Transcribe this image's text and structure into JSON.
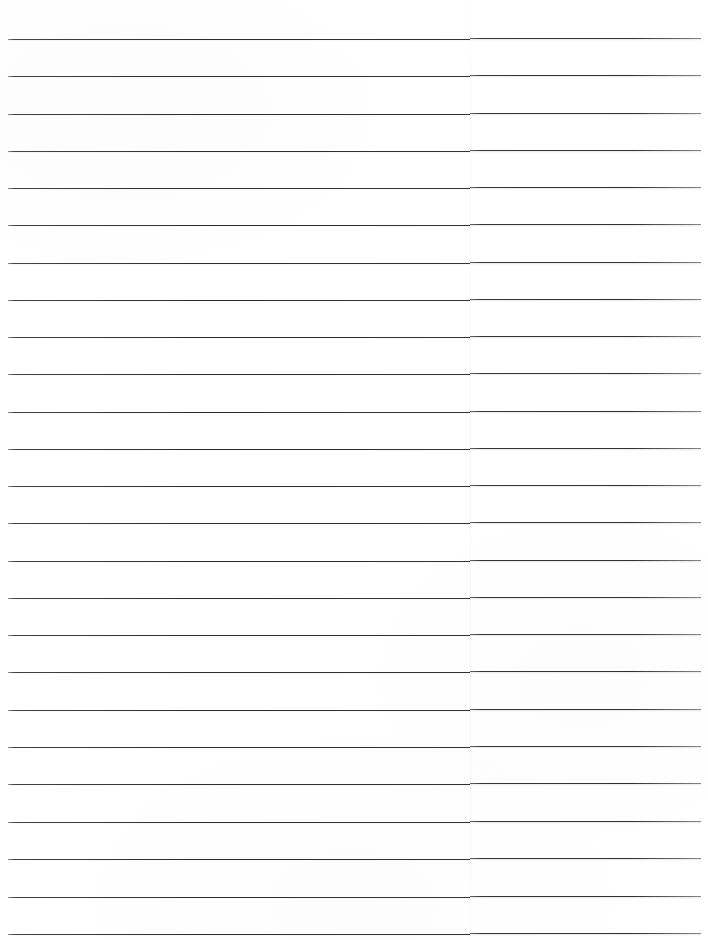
{
  "document": {
    "kind": "scanned-ruled-paper",
    "title": "Blank Lined Paper",
    "page_width": 708,
    "page_height": 940,
    "background_color": "#ffffff",
    "content_text": "",
    "handwriting_present": "no",
    "printed_text_present": "no"
  },
  "ruling": {
    "line_color": "#2f2f32",
    "line_thickness_px": 1,
    "line_count": 25,
    "first_line_y": 38,
    "line_spacing_px": 37.3,
    "left_margin_x": 8,
    "right_edge_x": 701,
    "orientation": "horizontal",
    "margin_rule_present": "no",
    "lines_y": [
      38,
      75,
      113,
      150,
      187,
      224,
      262,
      299,
      336,
      373,
      411,
      448,
      485,
      522,
      560,
      597,
      634,
      671,
      709,
      746,
      783,
      821,
      858,
      896,
      933
    ]
  },
  "scan_artifacts": {
    "seam_x": 470,
    "seam_description": "faint vertical scanner seam",
    "edge_fade": "slight fade at line ends"
  }
}
